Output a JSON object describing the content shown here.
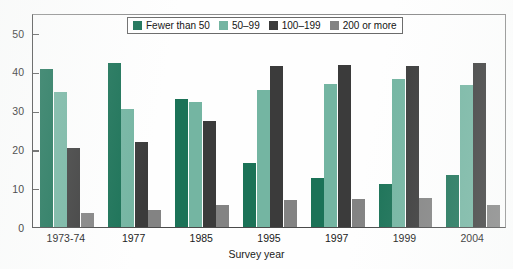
{
  "chart_data": {
    "type": "bar",
    "title": "",
    "xlabel": "Survey year",
    "ylabel": "",
    "ylim": [
      0,
      50
    ],
    "yticks": [
      0,
      10,
      20,
      30,
      40,
      50
    ],
    "ytick_labels": [
      "0",
      "10",
      "20",
      "30",
      "40",
      "50"
    ],
    "grid": false,
    "legend_position": "top-center",
    "categories": [
      "1973-74",
      "1977",
      "1985",
      "1995",
      "1997",
      "1999",
      "2004"
    ],
    "series": [
      {
        "name": "Fewer than 50",
        "color": "#1b7257",
        "values": [
          40.7,
          42.3,
          33.0,
          16.5,
          12.7,
          11.2,
          13.5
        ]
      },
      {
        "name": "50–99",
        "color": "#74b5a2",
        "values": [
          34.8,
          30.4,
          32.2,
          35.4,
          36.8,
          38.2,
          36.7
        ]
      },
      {
        "name": "100–199",
        "color": "#3b3b3b",
        "values": [
          20.3,
          22.0,
          27.2,
          41.6,
          41.8,
          41.4,
          42.2
        ]
      },
      {
        "name": "200 or more",
        "color": "#838383",
        "values": [
          3.7,
          4.3,
          5.8,
          6.9,
          7.2,
          7.6,
          5.6
        ]
      }
    ]
  },
  "legend": {
    "items": [
      {
        "label": "Fewer than 50",
        "color": "#1b7257"
      },
      {
        "label": "50–99",
        "color": "#74b5a2"
      },
      {
        "label": "100–199",
        "color": "#3b3b3b"
      },
      {
        "label": "200 or more",
        "color": "#838383"
      }
    ]
  },
  "axes": {
    "x_title": "Survey year",
    "y_tick_labels": [
      "50",
      "40",
      "30",
      "20",
      "10",
      "0"
    ],
    "x_tick_labels": [
      "1973-74",
      "1977",
      "1985",
      "1995",
      "1997",
      "1999",
      "2004"
    ]
  }
}
